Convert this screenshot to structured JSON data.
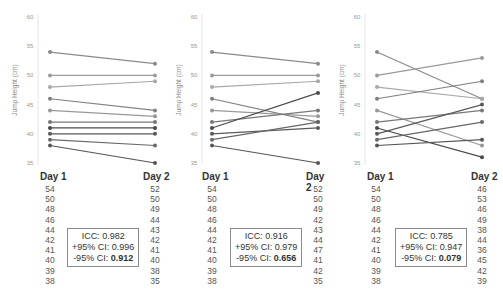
{
  "chart_data": [
    {
      "type": "line",
      "title": "",
      "xlabel": "",
      "ylabel": "Jump Height (cm)",
      "ylim": [
        35,
        60
      ],
      "yticks": [
        35,
        40,
        45,
        50,
        55,
        60
      ],
      "categories": [
        "Day 1",
        "Day 2"
      ],
      "day1": [
        54,
        50,
        48,
        46,
        44,
        42,
        41,
        40,
        39,
        38
      ],
      "day2": [
        52,
        50,
        49,
        44,
        43,
        42,
        41,
        40,
        38,
        35
      ],
      "stats": {
        "icc": "ICC: 0.982",
        "upper": "+95% CI: 0.996",
        "lower_label": "-95% CI: ",
        "lower_value": "0.912"
      }
    },
    {
      "type": "line",
      "title": "",
      "xlabel": "",
      "ylabel": "Jump Height (cm)",
      "ylim": [
        35,
        60
      ],
      "yticks": [
        35,
        40,
        45,
        50,
        55,
        60
      ],
      "categories": [
        "Day 1",
        "Day 2"
      ],
      "day1": [
        54,
        50,
        48,
        46,
        44,
        42,
        41,
        40,
        39,
        38
      ],
      "day2": [
        52,
        50,
        49,
        42,
        43,
        44,
        47,
        41,
        42,
        35
      ],
      "stats": {
        "icc": "ICC: 0.916",
        "upper": "+95% CI: 0.979",
        "lower_label": "-95% CI: ",
        "lower_value": "0.656"
      }
    },
    {
      "type": "line",
      "title": "",
      "xlabel": "",
      "ylabel": "Jump Height (cm)",
      "ylim": [
        35,
        60
      ],
      "yticks": [
        35,
        40,
        45,
        50,
        55,
        60
      ],
      "categories": [
        "Day 1",
        "Day 2"
      ],
      "day1": [
        54,
        50,
        48,
        46,
        44,
        42,
        41,
        40,
        39,
        38
      ],
      "day2": [
        46,
        53,
        46,
        49,
        38,
        44,
        36,
        45,
        42,
        39
      ],
      "stats": {
        "icc": "ICC: 0.785",
        "upper": "+95% CI: 0.947",
        "lower_label": "-95% CI: ",
        "lower_value": "0.079"
      }
    }
  ],
  "labels": {
    "day1": "Day 1",
    "day2": "Day 2"
  },
  "line_colors": [
    "#8a8a8a",
    "#9a9a9a",
    "#a8a8a8",
    "#808080",
    "#989898",
    "#777777",
    "#4a4a4a",
    "#5a5a5a",
    "#686868",
    "#555555"
  ]
}
